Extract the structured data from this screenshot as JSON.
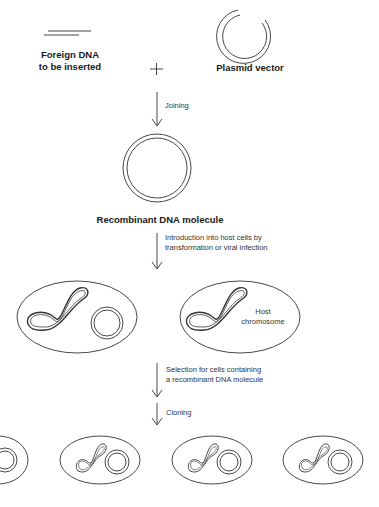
{
  "diagram": {
    "foreign_dna_label_line1": "Foreign DNA",
    "foreign_dna_label_line2": "to be inserted",
    "plus_sign": "+",
    "plasmid_label": "Plasmid vector",
    "step_joining": "Joining",
    "recombinant_label": "Recombinant DNA molecule",
    "step_introduction_line1": "Introduction into host cells by",
    "step_introduction_line2": "transformation or viral infection",
    "host_chromosome_line1": "Host",
    "host_chromosome_line2": "chromosome",
    "step_selection_line1": "Selection for cells containing",
    "step_selection_line2": "a recombinant DNA molecule",
    "step_cloning": "Cloning",
    "colors": {
      "line": "#333333",
      "text": "#1a1a1a",
      "background": "#ffffff"
    }
  }
}
